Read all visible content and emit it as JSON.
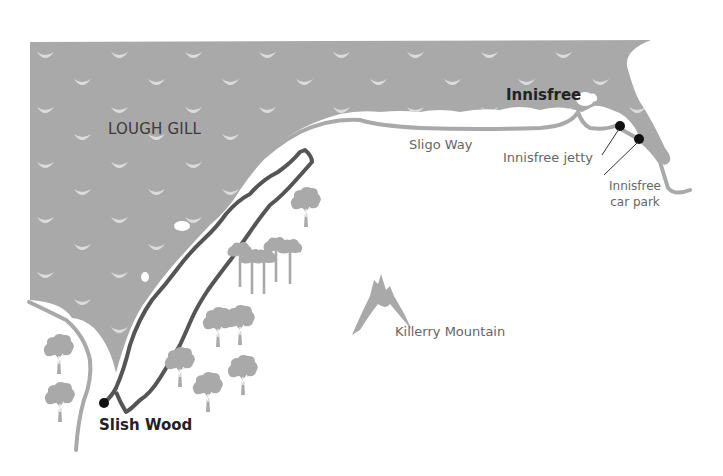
{
  "map": {
    "colors": {
      "water": "#a9a9a9",
      "wave": "#dcdcdc",
      "trail": "#555555",
      "path": "#a9a9a9",
      "tree": "#a9a9a9",
      "mountain": "#a9a9a9",
      "marker": "#111111"
    },
    "labels": {
      "lake": "LOUGH GILL",
      "innisfree": "Innisfree",
      "sligo_way": "Sligo Way",
      "innisfree_jetty": "Innisfree jetty",
      "car_park_line1": "Innisfree",
      "car_park_line2": "car park",
      "mountain": "Killerry Mountain",
      "slish_wood": "Slish Wood"
    },
    "markers": [
      {
        "name": "slish-wood-marker",
        "x": 104,
        "y": 403
      },
      {
        "name": "innisfree-jetty-marker",
        "x": 620,
        "y": 126
      },
      {
        "name": "innisfree-car-park-marker",
        "x": 639,
        "y": 139
      }
    ],
    "icons": [
      "wave-icon",
      "tree-icon",
      "mountain-icon",
      "marker-icon"
    ]
  }
}
